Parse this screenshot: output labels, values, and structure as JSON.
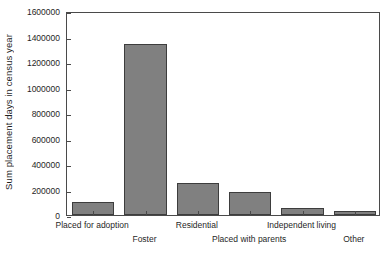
{
  "chart_data": {
    "type": "bar",
    "title": "",
    "subtitle": "",
    "xlabel": "",
    "ylabel": "Sum placement days in census year",
    "categories": [
      "Placed for adoption",
      "Foster",
      "Residential",
      "Placed with parents",
      "Independent living",
      "Other"
    ],
    "values": [
      102000,
      1345000,
      251000,
      180000,
      55000,
      31000
    ],
    "ylim": [
      0,
      1600000
    ],
    "yticks": [
      0,
      200000,
      400000,
      600000,
      800000,
      1000000,
      1200000,
      1400000,
      1600000
    ],
    "ytick_labels": [
      "0",
      "200000",
      "400000",
      "600000",
      "800000",
      "1000000",
      "1200000",
      "1400000",
      "1600000"
    ],
    "grid": false,
    "legend": null,
    "legend_position": "none",
    "bar_color": "#808080",
    "bar_edge_color": "#3d3d3d",
    "axis_color": "#4a4a4a",
    "background_color": "#ffffff",
    "label_stagger_rows": [
      0,
      1,
      0,
      1,
      0,
      1
    ]
  }
}
